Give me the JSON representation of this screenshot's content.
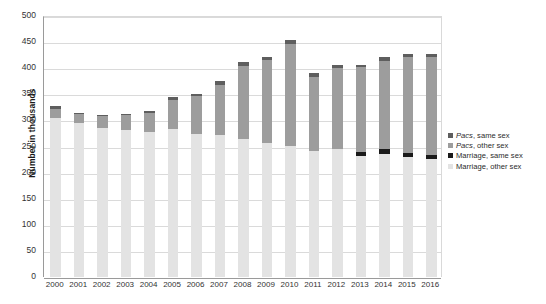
{
  "chart_data": {
    "type": "bar",
    "stacked": true,
    "title": "",
    "xlabel": "",
    "ylabel": "Number in thousands",
    "ylim": [
      0,
      500
    ],
    "yticks": [
      0,
      50,
      100,
      150,
      200,
      250,
      300,
      350,
      400,
      450,
      500
    ],
    "grid": true,
    "legend_position": "right",
    "categories": [
      "2000",
      "2001",
      "2002",
      "2003",
      "2004",
      "2005",
      "2006",
      "2007",
      "2008",
      "2009",
      "2010",
      "2011",
      "2012",
      "2013",
      "2014",
      "2015",
      "2016"
    ],
    "series": [
      {
        "name": "Marriage, other sex",
        "color": "#e3e3e3",
        "values": [
          305,
          295,
          286,
          282,
          278,
          283,
          274,
          273,
          265,
          256,
          251,
          241,
          246,
          232,
          235,
          230,
          226
        ]
      },
      {
        "name": "Marriage, same sex",
        "color": "#1a1a1a",
        "values": [
          0,
          0,
          0,
          0,
          0,
          0,
          0,
          0,
          0,
          0,
          0,
          0,
          0,
          7,
          10,
          7,
          7
        ]
      },
      {
        "name": "Pacs, other sex",
        "color": "#9d9d9d",
        "values": [
          17,
          17,
          22,
          28,
          36,
          57,
          72,
          95,
          140,
          159,
          196,
          143,
          154,
          163,
          169,
          184,
          188
        ]
      },
      {
        "name": "Pacs, same sex",
        "color": "#5e5e5e",
        "values": [
          5,
          3,
          3,
          3,
          4,
          5,
          4,
          7,
          6,
          6,
          8,
          6,
          6,
          5,
          7,
          6,
          6
        ]
      }
    ],
    "totals": [
      327,
      315,
      311,
      313,
      318,
      345,
      350,
      375,
      411,
      421,
      455,
      390,
      406,
      407,
      421,
      427,
      427
    ]
  },
  "legend": {
    "items": [
      {
        "label_prefix": "Pacs",
        "label_rest": ", same sex",
        "italic": true,
        "color": "#5e5e5e",
        "name": "pacs-same-sex"
      },
      {
        "label_prefix": "Pacs",
        "label_rest": ", other sex",
        "italic": true,
        "color": "#9d9d9d",
        "name": "pacs-other-sex"
      },
      {
        "label_prefix": "",
        "label_rest": "Marriage, same sex",
        "italic": false,
        "color": "#1a1a1a",
        "name": "marriage-same-sex"
      },
      {
        "label_prefix": "",
        "label_rest": "Marriage, other sex",
        "italic": false,
        "color": "#e3e3e3",
        "name": "marriage-other-sex"
      }
    ]
  },
  "colors": {
    "pacs_same": "#5e5e5e",
    "pacs_other": "#9d9d9d",
    "marriage_same": "#1a1a1a",
    "marriage_other": "#e3e3e3",
    "grid": "#dadada",
    "axis": "#9a9a9a",
    "text": "#2b2b2b",
    "background": "#ffffff"
  }
}
